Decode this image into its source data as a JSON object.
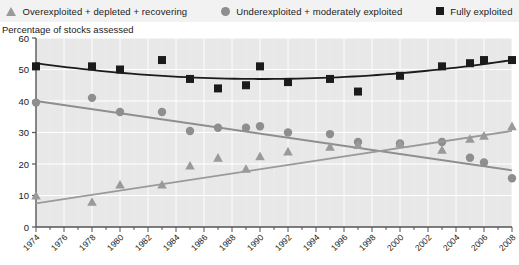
{
  "legend": {
    "items": [
      {
        "label": "Overexploited + depleted + recovering",
        "marker": "triangle-marker-icon",
        "color": "#9a9a9a",
        "key": "overexploited"
      },
      {
        "label": "Underexploited + moderately exploited",
        "marker": "circle-marker-icon",
        "color": "#8e8e8e",
        "key": "underexploited"
      },
      {
        "label": "Fully exploited",
        "marker": "square-marker-icon",
        "color": "#1b1b1b",
        "key": "fully"
      }
    ]
  },
  "chart_data": {
    "type": "scatter",
    "title": "",
    "subtitle": "",
    "xlabel": "",
    "ylabel": "Percentage of stocks assessed",
    "ylim": [
      0,
      60
    ],
    "yticks": [
      0,
      10,
      20,
      30,
      40,
      50,
      60
    ],
    "xlim": [
      1974,
      2008
    ],
    "xticks": [
      1974,
      1976,
      1978,
      1980,
      1982,
      1984,
      1986,
      1988,
      1990,
      1992,
      1994,
      1996,
      1998,
      2000,
      2002,
      2004,
      2006,
      2008
    ],
    "xtick_labels": [
      "1974",
      "1976",
      "1978",
      "1980",
      "1982",
      "1984",
      "1986",
      "1988",
      "1990",
      "1992",
      "1994",
      "1996",
      "1998",
      "2000",
      "2002",
      "2004",
      "2006",
      "2008"
    ],
    "grid": true,
    "legend_position": "top",
    "series": [
      {
        "name": "Fully exploited",
        "key": "fully",
        "marker": "square",
        "color": "#1b1b1b",
        "trend_color": "#1b1b1b",
        "x": [
          1974,
          1978,
          1980,
          1983,
          1985,
          1987,
          1989,
          1990,
          1992,
          1995,
          1997,
          2000,
          2003,
          2005,
          2006,
          2008
        ],
        "y": [
          51,
          51,
          50,
          53,
          47,
          44,
          45,
          51,
          46,
          47,
          43,
          48,
          51,
          52,
          53,
          53
        ],
        "trend": {
          "type": "quadratic",
          "x": [
            1974,
            1991,
            2008
          ],
          "y": [
            52,
            47,
            53
          ]
        }
      },
      {
        "name": "Underexploited + moderately exploited",
        "key": "underexploited",
        "marker": "circle",
        "color": "#8e8e8e",
        "trend_color": "#8e8e8e",
        "x": [
          1974,
          1978,
          1980,
          1983,
          1985,
          1987,
          1989,
          1990,
          1992,
          1995,
          1997,
          2000,
          2003,
          2005,
          2006,
          2008
        ],
        "y": [
          39.5,
          41,
          36.5,
          36.5,
          30.5,
          31.5,
          31.5,
          32,
          30,
          29.5,
          27,
          26.5,
          27,
          22,
          20.5,
          15.5
        ],
        "trend": {
          "type": "linear",
          "x": [
            1974,
            2008
          ],
          "y": [
            40,
            18
          ]
        }
      },
      {
        "name": "Overexploited + depleted + recovering",
        "key": "overexploited",
        "marker": "triangle",
        "color": "#9a9a9a",
        "trend_color": "#9a9a9a",
        "x": [
          1974,
          1978,
          1980,
          1983,
          1985,
          1987,
          1989,
          1990,
          1992,
          1995,
          1997,
          2000,
          2003,
          2005,
          2006,
          2008
        ],
        "y": [
          10,
          8,
          13.5,
          13.5,
          19.5,
          22,
          18.5,
          22.5,
          24,
          25.5,
          26,
          26.5,
          24.5,
          28,
          29,
          32
        ],
        "trend": {
          "type": "linear",
          "x": [
            1974,
            2008
          ],
          "y": [
            7.5,
            30.5
          ]
        }
      }
    ]
  },
  "colors": {
    "plot_background": "#e8e8e8",
    "legend_background": "#f2f2f2",
    "grid": "#ffffff",
    "axis": "#555555",
    "text": "#1a1a1a"
  }
}
